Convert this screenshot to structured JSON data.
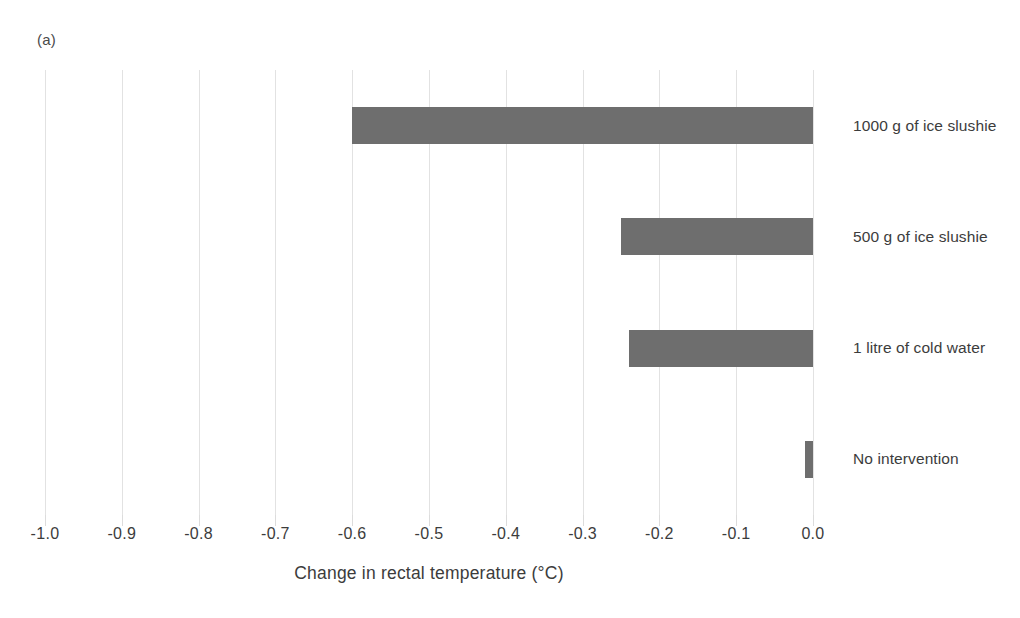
{
  "panel": {
    "label": "(a)"
  },
  "axis": {
    "x_title": "Change in rectal temperature (°C)",
    "tick_labels": [
      "-1.0",
      "-0.9",
      "-0.8",
      "-0.7",
      "-0.6",
      "-0.5",
      "-0.4",
      "-0.3",
      "-0.2",
      "-0.1",
      "0.0"
    ]
  },
  "categories": [
    {
      "label": "1000 g of ice slushie"
    },
    {
      "label": "500 g of ice slushie"
    },
    {
      "label": "1 litre of cold water"
    },
    {
      "label": "No intervention"
    }
  ],
  "colors": {
    "bar_fill": "#6e6e6e",
    "gridline": "#e2e2e2",
    "text": "#3c3c3c",
    "background": "#ffffff"
  },
  "chart_data": {
    "type": "bar",
    "orientation": "horizontal",
    "title": "",
    "subtitle": "",
    "panel_label": "(a)",
    "categories": [
      "1000 g of ice slushie",
      "500 g of ice slushie",
      "1 litre of cold water",
      "No intervention"
    ],
    "values": [
      -0.6,
      -0.25,
      -0.24,
      -0.01
    ],
    "xlabel": "Change in rectal temperature (°C)",
    "ylabel": "",
    "xlim": [
      -1.0,
      0.0
    ],
    "xticks": [
      -1.0,
      -0.9,
      -0.8,
      -0.7,
      -0.6,
      -0.5,
      -0.4,
      -0.3,
      -0.2,
      -0.1,
      0.0
    ],
    "xticklabels": [
      "-1.0",
      "-0.9",
      "-0.8",
      "-0.7",
      "-0.6",
      "-0.5",
      "-0.4",
      "-0.3",
      "-0.2",
      "-0.1",
      "0.0"
    ],
    "grid": "vertical",
    "legend": "none",
    "series": [
      {
        "name": "Change in rectal temperature",
        "values": [
          -0.6,
          -0.25,
          -0.24,
          -0.01
        ],
        "color": "#6e6e6e"
      }
    ]
  }
}
